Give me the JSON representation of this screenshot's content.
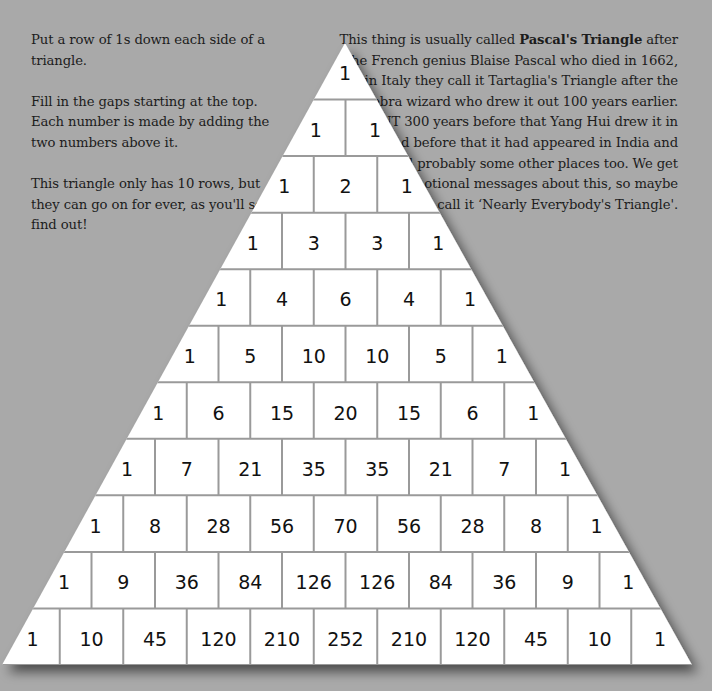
{
  "left_text": {
    "paragraphs": [
      "Put a row of 1s down each side of a triangle.",
      "Fill in the gaps starting at the top. Each number is made by adding the two numbers above it.",
      "This triangle only has 10 rows, but they can go on for ever, as you'll soon find out!"
    ]
  },
  "right_text": {
    "intro": "This thing is usually called ",
    "bold": "Pascal's Triangle",
    "rest": " after the French genius Blaise Pascal who died in 1662, but in Italy they call it Tartaglia's Triangle after the algebra wizard who drew it out 100 years earlier. BUT 300 years before that Yang Hui drew it in China, and before that it had appeared in India and Iran and probably some other places too. We get tons of emotional messages about this, so maybe we should call it ‘Nearly Everybody's Triangle'."
  },
  "colors": {
    "background": "#a9a9a9",
    "cell_fill": "#ffffff",
    "cell_border": "#9a9a9a",
    "text": "#1c1c1c"
  },
  "triangle": {
    "rows": [
      [
        1
      ],
      [
        1,
        1
      ],
      [
        1,
        2,
        1
      ],
      [
        1,
        3,
        3,
        1
      ],
      [
        1,
        4,
        6,
        4,
        1
      ],
      [
        1,
        5,
        10,
        10,
        5,
        1
      ],
      [
        1,
        6,
        15,
        20,
        15,
        6,
        1
      ],
      [
        1,
        7,
        21,
        35,
        35,
        21,
        7,
        1
      ],
      [
        1,
        8,
        28,
        56,
        70,
        56,
        28,
        8,
        1
      ],
      [
        1,
        9,
        36,
        84,
        126,
        126,
        84,
        36,
        9,
        1
      ],
      [
        1,
        10,
        45,
        120,
        210,
        252,
        210,
        120,
        45,
        10,
        1
      ]
    ]
  }
}
